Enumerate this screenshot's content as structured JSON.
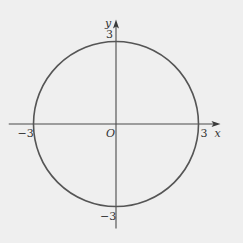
{
  "chart_data": {
    "type": "line",
    "title": "",
    "curve": {
      "name": "circle",
      "center": [
        0,
        0
      ],
      "radius": 3
    },
    "xlabel": "x",
    "ylabel": "y",
    "origin_label": "O",
    "xlim": [
      -3.9,
      3.8
    ],
    "ylim": [
      -3.8,
      3.8
    ],
    "x_ticks": [
      {
        "value": -3,
        "label": "−3"
      },
      {
        "value": 3,
        "label": "3"
      }
    ],
    "y_ticks": [
      {
        "value": 3,
        "label": "3"
      },
      {
        "value": -3,
        "label": "−3"
      }
    ],
    "grid": false,
    "legend": "none"
  }
}
